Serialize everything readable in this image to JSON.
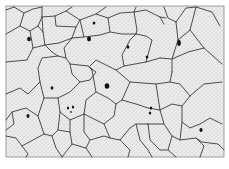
{
  "figure": {
    "colors": {
      "background": "#ffffff",
      "cell_fill": "#ececec",
      "stipple": "#9a9a9a",
      "outline": "#3a3a3a",
      "nucleus": "#111111",
      "frame": "#8a8a8a"
    },
    "frame": {
      "x": 6,
      "y": 6,
      "width": 218,
      "height": 151
    },
    "edges": [
      "6,10 14,7",
      "14,7 24,13 33,9 42,7",
      "24,13 20,26 6,34",
      "20,26 30,31 38,26 42,17 42,7",
      "42,17 55,16 66,11 72,7",
      "42,17 43,32",
      "38,26 43,32 45,45",
      "30,31 33,48 27,60 6,62",
      "33,48 45,45 52,52",
      "45,45 59,43 72,38 76,27 80,20",
      "55,16 56,26 76,27",
      "66,11 80,20 96,14 106,7",
      "80,20 84,37 72,38",
      "96,14 108,18 110,32 100,35 84,37",
      "108,18 120,13 134,12",
      "110,32 122,34 136,34",
      "136,7 134,12 137,30 136,34",
      "134,12 146,10 160,17 164,24",
      "160,17 166,18",
      "164,7 168,18 176,22",
      "176,22 186,8 196,7 212,12 220,26",
      "196,7 190,30 178,40 176,22",
      "190,30 204,48 222,64",
      "204,48 188,52 172,59 178,40",
      "136,34 130,40 122,55 124,66 146,62 160,58",
      "124,66 116,70 96,60 90,66",
      "146,62 152,40 146,36 136,34",
      "160,58 172,59 172,72",
      "172,72 170,82 156,84 130,82 116,70",
      "52,52 58,56 66,58 70,64 88,66 92,70",
      "58,56 42,58 38,68 40,82",
      "70,64 72,74 80,82 90,80 96,72 88,66",
      "66,58 64,48 72,38",
      "6,94 20,88 28,94 40,82",
      "40,82 44,98 58,98 70,92 80,82",
      "44,98 38,116 26,108 12,112 6,120",
      "58,98 60,112 70,120 84,114 86,100 96,92 92,70",
      "96,92 108,98 116,104 122,100 130,82",
      "116,104 114,116 104,124 92,118 84,114",
      "104,124 110,138 120,140 130,128 136,124 148,124",
      "122,100 136,104 148,108 160,110 164,124 148,124",
      "160,110 172,104 182,106 190,96 204,84 222,82",
      "156,84 160,110",
      "190,96 180,84 170,82",
      "182,106 182,122 190,128 200,124 210,118 222,124",
      "164,124 172,136 180,140 182,122",
      "172,136 168,150 176,157",
      "180,140 196,138 204,146 200,157",
      "196,138 202,142 218,144 224,150",
      "6,136 16,138 22,146 28,154 26,157",
      "38,116 42,128 44,134 52,136 58,130 60,112",
      "22,146 44,134",
      "52,136 56,148 62,157",
      "58,130 70,132 72,144 62,157",
      "70,132 70,120",
      "72,144 86,148 92,157",
      "84,114 84,132 90,140 104,136 110,138",
      "90,140 86,148",
      "120,140 130,150 128,157",
      "136,124 140,140 148,150 152,157",
      "148,124 150,140 160,150 168,150",
      "12,112 14,124 6,130"
    ],
    "nuclei": [
      {
        "cx": 29,
        "cy": 39,
        "rx": 1.9,
        "ry": 2.3
      },
      {
        "cx": 94,
        "cy": 23,
        "rx": 1.4,
        "ry": 1.6
      },
      {
        "cx": 89,
        "cy": 39,
        "rx": 2.0,
        "ry": 2.4
      },
      {
        "cx": 128,
        "cy": 47,
        "rx": 1.3,
        "ry": 1.8
      },
      {
        "cx": 147,
        "cy": 57,
        "rx": 1.3,
        "ry": 1.6
      },
      {
        "cx": 179,
        "cy": 43,
        "rx": 1.8,
        "ry": 3.0
      },
      {
        "cx": 107,
        "cy": 86,
        "rx": 2.3,
        "ry": 2.8
      },
      {
        "cx": 52,
        "cy": 88,
        "rx": 1.4,
        "ry": 1.7
      },
      {
        "cx": 28,
        "cy": 116,
        "rx": 1.5,
        "ry": 2.0
      },
      {
        "cx": 68,
        "cy": 108,
        "rx": 1.1,
        "ry": 1.5
      },
      {
        "cx": 73,
        "cy": 107,
        "rx": 1.1,
        "ry": 1.5
      },
      {
        "cx": 71,
        "cy": 112,
        "rx": 0.8,
        "ry": 0.9
      },
      {
        "cx": 151,
        "cy": 108,
        "rx": 1.2,
        "ry": 1.5
      },
      {
        "cx": 150,
        "cy": 113,
        "rx": 1.2,
        "ry": 1.6
      },
      {
        "cx": 201,
        "cy": 130,
        "rx": 1.6,
        "ry": 2.1
      }
    ]
  }
}
